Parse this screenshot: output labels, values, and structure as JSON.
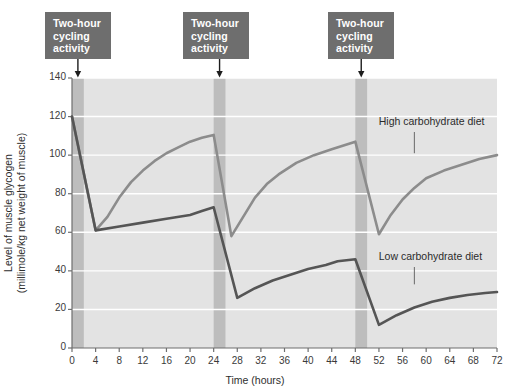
{
  "figure": {
    "background_color": "#ffffff",
    "plot_background_color": "#e3e3e3",
    "gridline_color": "#ffffff",
    "exercise_band_color": "#bdbdbd",
    "callout_box_color": "#6e6e6e",
    "callout_text_color": "#ffffff",
    "axis_color": "#6f6f6f"
  },
  "annotations": {
    "callouts": [
      {
        "line1": "Two-hour",
        "line2": "cycling",
        "line3": "activity",
        "arrow_hour": 1
      },
      {
        "line1": "Two-hour",
        "line2": "cycling",
        "line3": "activity",
        "arrow_hour": 25
      },
      {
        "line1": "Two-hour",
        "line2": "cycling",
        "line3": "activity",
        "arrow_hour": 49
      }
    ]
  },
  "chart_data": {
    "type": "line",
    "title": "",
    "xlabel": "Time (hours)",
    "ylabel": "Level of muscle glycogen (millimole/kg net weight of muscle)",
    "ylabel_line1": "Level of muscle glycogen",
    "ylabel_line2": "(millimole/kg net weight of muscle)",
    "xlim": [
      0,
      72
    ],
    "ylim": [
      0,
      140
    ],
    "xticks": [
      0,
      4,
      8,
      12,
      16,
      20,
      24,
      28,
      32,
      36,
      40,
      44,
      48,
      52,
      56,
      60,
      64,
      68,
      72
    ],
    "yticks": [
      0,
      20,
      40,
      60,
      80,
      100,
      120,
      140
    ],
    "grid": "horizontal",
    "legend_position": "inline-annotation",
    "shaded_regions": [
      {
        "label": "Two-hour cycling activity",
        "x_start": 0,
        "x_end": 2
      },
      {
        "label": "Two-hour cycling activity",
        "x_start": 24,
        "x_end": 26
      },
      {
        "label": "Two-hour cycling activity",
        "x_start": 48,
        "x_end": 50
      }
    ],
    "series": [
      {
        "name": "High carbohydrate diet",
        "color": "#8c8c8c",
        "width": 2.6,
        "label_x": 54,
        "label_y": 117,
        "leader_from": [
          58,
          112
        ],
        "leader_to": [
          58,
          101
        ],
        "points": [
          [
            0,
            120
          ],
          [
            4,
            61
          ],
          [
            6,
            68
          ],
          [
            8,
            78
          ],
          [
            10,
            86
          ],
          [
            12,
            92
          ],
          [
            14,
            97
          ],
          [
            16,
            101
          ],
          [
            18,
            104
          ],
          [
            20,
            107
          ],
          [
            22,
            109
          ],
          [
            24,
            110.5
          ],
          [
            27,
            58
          ],
          [
            29,
            68
          ],
          [
            31,
            78
          ],
          [
            33,
            85
          ],
          [
            35,
            90
          ],
          [
            38,
            96
          ],
          [
            41,
            100
          ],
          [
            44,
            103
          ],
          [
            46,
            105
          ],
          [
            48,
            107
          ],
          [
            52,
            59
          ],
          [
            54,
            69
          ],
          [
            56,
            77
          ],
          [
            58,
            83
          ],
          [
            60,
            88
          ],
          [
            63,
            92
          ],
          [
            66,
            95
          ],
          [
            69,
            98
          ],
          [
            72,
            100
          ]
        ]
      },
      {
        "name": "Low carbohydrate diet",
        "color": "#555555",
        "width": 2.6,
        "label_x": 54,
        "label_y": 47,
        "leader_from": [
          58,
          42
        ],
        "leader_to": [
          58,
          33
        ],
        "points": [
          [
            0,
            120
          ],
          [
            4,
            61
          ],
          [
            8,
            63
          ],
          [
            12,
            65
          ],
          [
            16,
            67
          ],
          [
            20,
            69
          ],
          [
            22,
            71
          ],
          [
            24,
            73
          ],
          [
            28,
            26
          ],
          [
            31,
            31
          ],
          [
            34,
            35
          ],
          [
            37,
            38
          ],
          [
            40,
            41
          ],
          [
            43,
            43
          ],
          [
            45,
            45
          ],
          [
            48,
            46
          ],
          [
            52,
            12
          ],
          [
            55,
            17
          ],
          [
            58,
            21
          ],
          [
            61,
            24
          ],
          [
            64,
            26
          ],
          [
            67,
            27.5
          ],
          [
            70,
            28.5
          ],
          [
            72,
            29
          ]
        ]
      }
    ]
  }
}
